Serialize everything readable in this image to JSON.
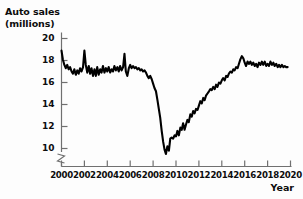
{
  "chart_data": {
    "type": "line",
    "title": "Auto sales\n(millions)",
    "title_line1": "Auto sales",
    "title_line2": "(millions)",
    "xlabel": "Year",
    "ylabel": "Auto sales (millions)",
    "xlim": [
      2000,
      2020
    ],
    "ylim": [
      9,
      20.6
    ],
    "yaxis_break": true,
    "grid": false,
    "legend": null,
    "line_color": "#000000",
    "background_color": "#fdfdfd",
    "xticks": [
      2000,
      2002,
      2004,
      2006,
      2008,
      2010,
      2012,
      2014,
      2016,
      2018,
      2020
    ],
    "xtick_labels": [
      "2000",
      "2002",
      "2004",
      "2006",
      "2008",
      "2010",
      "2012",
      "2014",
      "2016",
      "2018",
      "2020"
    ],
    "yticks": [
      10,
      12,
      14,
      16,
      18,
      20
    ],
    "ytick_labels": [
      "10",
      "12",
      "14",
      "16",
      "18",
      "20"
    ],
    "series": [
      {
        "name": "Auto sales",
        "x": [
          2000.0,
          2000.12,
          2000.25,
          2000.38,
          2000.5,
          2000.62,
          2000.75,
          2000.88,
          2001.0,
          2001.12,
          2001.25,
          2001.38,
          2001.5,
          2001.62,
          2001.75,
          2001.88,
          2002.0,
          2002.12,
          2002.25,
          2002.38,
          2002.5,
          2002.62,
          2002.75,
          2002.88,
          2003.0,
          2003.12,
          2003.25,
          2003.38,
          2003.5,
          2003.62,
          2003.75,
          2003.88,
          2004.0,
          2004.12,
          2004.25,
          2004.38,
          2004.5,
          2004.62,
          2004.75,
          2004.88,
          2005.0,
          2005.12,
          2005.25,
          2005.38,
          2005.5,
          2005.62,
          2005.75,
          2005.88,
          2006.0,
          2006.12,
          2006.25,
          2006.38,
          2006.5,
          2006.62,
          2006.75,
          2006.88,
          2007.0,
          2007.12,
          2007.25,
          2007.38,
          2007.5,
          2007.62,
          2007.75,
          2007.88,
          2008.0,
          2008.12,
          2008.25,
          2008.38,
          2008.5,
          2008.62,
          2008.75,
          2008.88,
          2009.0,
          2009.12,
          2009.25,
          2009.38,
          2009.5,
          2009.62,
          2009.75,
          2009.88,
          2010.0,
          2010.12,
          2010.25,
          2010.38,
          2010.5,
          2010.62,
          2010.75,
          2010.88,
          2011.0,
          2011.12,
          2011.25,
          2011.38,
          2011.5,
          2011.62,
          2011.75,
          2011.88,
          2012.0,
          2012.12,
          2012.25,
          2012.38,
          2012.5,
          2012.62,
          2012.75,
          2012.88,
          2013.0,
          2013.12,
          2013.25,
          2013.38,
          2013.5,
          2013.62,
          2013.75,
          2013.88,
          2014.0,
          2014.12,
          2014.25,
          2014.38,
          2014.5,
          2014.62,
          2014.75,
          2014.88,
          2015.0,
          2015.12,
          2015.25,
          2015.38,
          2015.5,
          2015.62,
          2015.75,
          2015.88,
          2016.0,
          2016.12,
          2016.25,
          2016.38,
          2016.5,
          2016.62,
          2016.75,
          2016.88,
          2017.0,
          2017.12,
          2017.25,
          2017.38,
          2017.5,
          2017.62,
          2017.75,
          2017.88,
          2018.0,
          2018.12,
          2018.25,
          2018.38,
          2018.5,
          2018.62,
          2018.75,
          2018.88,
          2019.0,
          2019.12,
          2019.25,
          2019.38,
          2019.5,
          2019.62,
          2019.75
        ],
        "y": [
          18.9,
          18.1,
          17.6,
          17.3,
          17.6,
          17.2,
          17.4,
          17.0,
          16.8,
          17.2,
          16.7,
          17.1,
          16.8,
          17.3,
          17.0,
          17.4,
          18.9,
          17.6,
          16.9,
          17.5,
          16.8,
          17.3,
          16.6,
          17.2,
          16.6,
          17.4,
          16.7,
          17.2,
          16.9,
          17.5,
          16.9,
          17.3,
          17.0,
          17.4,
          16.9,
          17.2,
          17.0,
          17.5,
          17.1,
          17.4,
          17.0,
          17.5,
          17.1,
          17.4,
          18.6,
          17.0,
          16.6,
          17.3,
          17.6,
          17.3,
          17.5,
          17.3,
          17.4,
          17.2,
          17.3,
          17.1,
          17.2,
          17.0,
          17.1,
          16.9,
          16.6,
          16.4,
          16.6,
          16.3,
          15.9,
          15.5,
          15.2,
          14.4,
          13.6,
          12.8,
          11.6,
          10.6,
          9.9,
          9.5,
          10.2,
          9.8,
          10.9,
          11.0,
          10.9,
          11.2,
          11.1,
          11.6,
          11.2,
          11.9,
          11.7,
          12.3,
          11.7,
          12.2,
          12.6,
          12.4,
          13.1,
          12.9,
          13.4,
          13.2,
          13.6,
          13.5,
          13.9,
          14.3,
          14.1,
          14.6,
          14.4,
          14.8,
          15.0,
          15.2,
          15.4,
          15.3,
          15.6,
          15.4,
          15.8,
          15.6,
          16.0,
          15.9,
          16.2,
          16.4,
          16.2,
          16.6,
          16.5,
          16.8,
          17.0,
          16.9,
          17.2,
          17.1,
          17.4,
          17.3,
          17.7,
          18.1,
          18.4,
          18.2,
          17.8,
          17.5,
          17.9,
          17.7,
          17.9,
          17.6,
          17.8,
          17.5,
          17.7,
          17.4,
          17.8,
          17.6,
          17.9,
          17.6,
          17.9,
          17.5,
          17.7,
          17.5,
          17.9,
          17.6,
          17.8,
          17.5,
          17.7,
          17.4,
          17.6,
          17.4,
          17.6,
          17.4,
          17.5,
          17.4,
          17.4
        ]
      }
    ]
  }
}
